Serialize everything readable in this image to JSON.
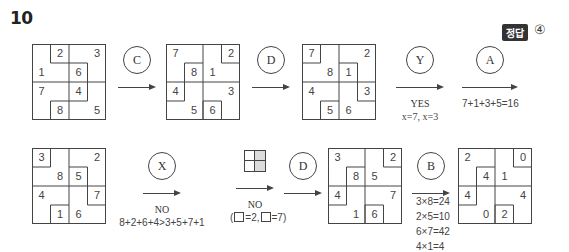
{
  "question_number": "10",
  "answer": {
    "badge": "정답",
    "value": "④"
  },
  "colors": {
    "line": "#444444",
    "badge_bg": "#333333",
    "mini_shade": "#cfcfcf"
  },
  "grids": [
    {
      "id": "g1",
      "segments": [
        [
          1,
          0,
          1,
          1
        ],
        [
          1,
          1,
          2,
          1
        ],
        [
          2,
          1,
          3,
          1
        ],
        [
          3,
          1,
          3,
          2
        ],
        [
          1,
          4,
          1,
          3
        ],
        [
          1,
          3,
          2,
          3
        ],
        [
          2,
          3,
          3,
          3
        ],
        [
          3,
          3,
          3,
          2
        ]
      ],
      "cells": [
        {
          "v": "2",
          "x": 1,
          "y": 0
        },
        {
          "v": "3",
          "x": 3,
          "y": 0
        },
        {
          "v": "1",
          "x": 0,
          "y": 1
        },
        {
          "v": "6",
          "x": 2,
          "y": 1
        },
        {
          "v": "7",
          "x": 0,
          "y": 2
        },
        {
          "v": "4",
          "x": 2,
          "y": 2
        },
        {
          "v": "8",
          "x": 1,
          "y": 3
        },
        {
          "v": "5",
          "x": 3,
          "y": 3
        }
      ]
    },
    {
      "id": "g2",
      "segments": [
        [
          3,
          0,
          3,
          1
        ],
        [
          3,
          1,
          4,
          1
        ],
        [
          1,
          2,
          1,
          1
        ],
        [
          1,
          1,
          2,
          1
        ],
        [
          0,
          3,
          1,
          3
        ],
        [
          1,
          3,
          1,
          2
        ],
        [
          2,
          4,
          2,
          3
        ],
        [
          2,
          3,
          3,
          3
        ],
        [
          3,
          3,
          3,
          4
        ]
      ],
      "cells": [
        {
          "v": "7",
          "x": 0,
          "y": 0
        },
        {
          "v": "2",
          "x": 3,
          "y": 0
        },
        {
          "v": "8",
          "x": 1,
          "y": 1
        },
        {
          "v": "1",
          "x": 2,
          "y": 1
        },
        {
          "v": "4",
          "x": 0,
          "y": 2
        },
        {
          "v": "3",
          "x": 3,
          "y": 2
        },
        {
          "v": "5",
          "x": 1,
          "y": 3
        },
        {
          "v": "6",
          "x": 2,
          "y": 3
        }
      ]
    },
    {
      "id": "g3",
      "segments": [
        [
          0,
          1,
          1,
          1
        ],
        [
          1,
          1,
          1,
          0
        ],
        [
          2,
          1,
          3,
          1
        ],
        [
          3,
          1,
          3,
          2
        ],
        [
          1,
          4,
          1,
          3
        ],
        [
          1,
          3,
          2,
          3
        ],
        [
          3,
          2,
          3,
          3
        ],
        [
          3,
          3,
          4,
          3
        ]
      ],
      "cells": [
        {
          "v": "7",
          "x": 0,
          "y": 0
        },
        {
          "v": "2",
          "x": 3,
          "y": 0
        },
        {
          "v": "8",
          "x": 1,
          "y": 1
        },
        {
          "v": "1",
          "x": 2,
          "y": 1
        },
        {
          "v": "4",
          "x": 0,
          "y": 2
        },
        {
          "v": "3",
          "x": 3,
          "y": 2
        },
        {
          "v": "5",
          "x": 1,
          "y": 3
        },
        {
          "v": "6",
          "x": 2,
          "y": 3
        }
      ]
    },
    {
      "id": "g4",
      "segments": [
        [
          0,
          1,
          1,
          1
        ],
        [
          1,
          1,
          1,
          0
        ],
        [
          2,
          1,
          3,
          1
        ],
        [
          3,
          1,
          3,
          2
        ],
        [
          1,
          4,
          1,
          3
        ],
        [
          1,
          3,
          2,
          3
        ],
        [
          3,
          2,
          3,
          3
        ],
        [
          3,
          3,
          4,
          3
        ]
      ],
      "cells": [
        {
          "v": "3",
          "x": 0,
          "y": 0
        },
        {
          "v": "2",
          "x": 3,
          "y": 0
        },
        {
          "v": "8",
          "x": 1,
          "y": 1
        },
        {
          "v": "5",
          "x": 2,
          "y": 1
        },
        {
          "v": "4",
          "x": 0,
          "y": 2
        },
        {
          "v": "7",
          "x": 3,
          "y": 2
        },
        {
          "v": "1",
          "x": 1,
          "y": 3
        },
        {
          "v": "6",
          "x": 2,
          "y": 3
        }
      ]
    },
    {
      "id": "g6",
      "segments": [
        [
          3,
          0,
          3,
          1
        ],
        [
          3,
          1,
          4,
          1
        ],
        [
          1,
          2,
          1,
          1
        ],
        [
          1,
          1,
          2,
          1
        ],
        [
          0,
          3,
          1,
          3
        ],
        [
          1,
          3,
          1,
          2
        ],
        [
          2,
          4,
          2,
          3
        ],
        [
          2,
          3,
          3,
          3
        ],
        [
          3,
          3,
          3,
          4
        ]
      ],
      "cells": [
        {
          "v": "3",
          "x": 0,
          "y": 0
        },
        {
          "v": "2",
          "x": 3,
          "y": 0
        },
        {
          "v": "8",
          "x": 1,
          "y": 1
        },
        {
          "v": "5",
          "x": 2,
          "y": 1
        },
        {
          "v": "4",
          "x": 0,
          "y": 2
        },
        {
          "v": "7",
          "x": 3,
          "y": 2
        },
        {
          "v": "1",
          "x": 1,
          "y": 3
        },
        {
          "v": "6",
          "x": 2,
          "y": 3
        }
      ]
    },
    {
      "id": "g7",
      "segments": [
        [
          3,
          0,
          3,
          1
        ],
        [
          3,
          1,
          4,
          1
        ],
        [
          1,
          2,
          1,
          1
        ],
        [
          1,
          1,
          2,
          1
        ],
        [
          0,
          3,
          1,
          3
        ],
        [
          1,
          3,
          1,
          2
        ],
        [
          2,
          4,
          2,
          3
        ],
        [
          2,
          3,
          3,
          3
        ],
        [
          3,
          3,
          3,
          4
        ]
      ],
      "cells": [
        {
          "v": "2",
          "x": 0,
          "y": 0
        },
        {
          "v": "0",
          "x": 3,
          "y": 0
        },
        {
          "v": "4",
          "x": 1,
          "y": 1
        },
        {
          "v": "1",
          "x": 2,
          "y": 1
        },
        {
          "v": "4",
          "x": 0,
          "y": 2
        },
        {
          "v": "4",
          "x": 3,
          "y": 2
        },
        {
          "v": "0",
          "x": 1,
          "y": 3
        },
        {
          "v": "2",
          "x": 2,
          "y": 3
        }
      ]
    }
  ],
  "steps": {
    "c": {
      "label": "C"
    },
    "d1": {
      "label": "D"
    },
    "y": {
      "label": "Y",
      "result": "YES",
      "note": "x=7, x=3"
    },
    "a": {
      "label": "A",
      "note": "7+1+3+5=16"
    },
    "x": {
      "label": "X",
      "result": "NO",
      "note": "8+2+6+4>3+5+7+1"
    },
    "mini": {
      "result": "NO",
      "note_open": "(",
      "note_eq1": "=2,",
      "note_eq2": "=7)"
    },
    "d2": {
      "label": "D"
    },
    "b": {
      "label": "B",
      "products": [
        "3×8=24",
        "2×5=10",
        "6×7=42",
        "4×1=4"
      ]
    }
  }
}
